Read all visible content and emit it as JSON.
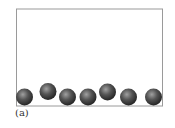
{
  "figure": {
    "caption": "(a)",
    "container": {
      "x": 16.5,
      "y": 9,
      "width": 146,
      "height": 97,
      "stroke": "#9a9a9a"
    },
    "ball_color": "#444444",
    "ball_highlight": "#9a9a9a",
    "balls": [
      {
        "cx": 24.5,
        "cy": 97,
        "r": 8.5
      },
      {
        "cx": 48,
        "cy": 91.5,
        "r": 8.5
      },
      {
        "cx": 67.5,
        "cy": 97,
        "r": 8.5
      },
      {
        "cx": 88,
        "cy": 97,
        "r": 8.5
      },
      {
        "cx": 107.5,
        "cy": 92,
        "r": 8.5
      },
      {
        "cx": 128.5,
        "cy": 97,
        "r": 8.5
      },
      {
        "cx": 153.5,
        "cy": 97,
        "r": 8.5
      }
    ]
  }
}
